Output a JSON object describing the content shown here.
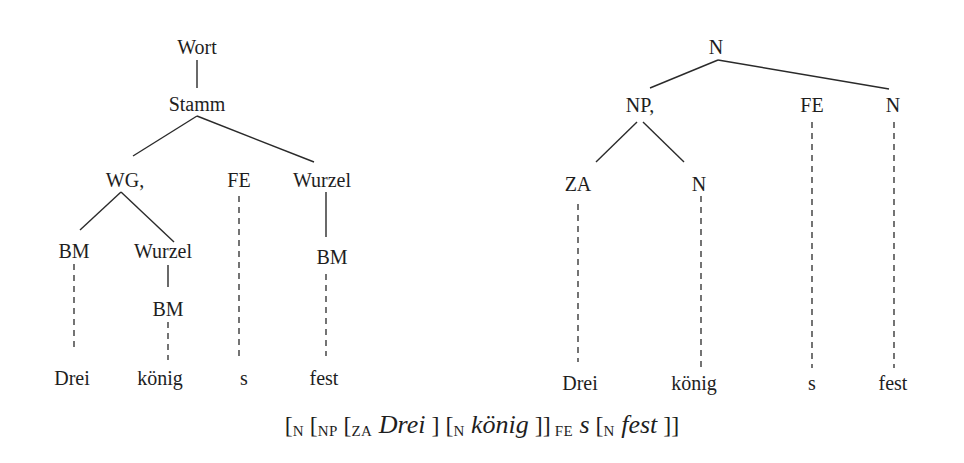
{
  "left_tree": {
    "root": "Wort",
    "stem": "Stamm",
    "level2": {
      "wg": "WG,",
      "fe": "FE",
      "wurzel": "Wurzel"
    },
    "level3": {
      "bm": "BM",
      "wurzel": "Wurzel",
      "bm_right": "BM"
    },
    "level4": {
      "bm": "BM"
    },
    "leaves": [
      "Drei",
      "könig",
      "s",
      "fest"
    ]
  },
  "right_tree": {
    "root": "N",
    "level2": {
      "np": "NP,",
      "fe": "FE",
      "n": "N"
    },
    "level3": {
      "za": "ZA",
      "n": "N"
    },
    "leaves": [
      "Drei",
      "könig",
      "s",
      "fest"
    ]
  },
  "bracket_notation": {
    "open1": "[",
    "lbl_n1": "N",
    "open2": " [",
    "lbl_np": "NP",
    "open3": " [",
    "lbl_za": "ZA",
    "word_drei": " Drei",
    "close1": " ] [",
    "lbl_n2": "N",
    "word_koenig": " könig",
    "close2": " ]]",
    "lbl_fe": " FE",
    "word_s": " s",
    "open4": " [",
    "lbl_n3": "N",
    "word_fest": " fest",
    "close3": " ]]"
  }
}
